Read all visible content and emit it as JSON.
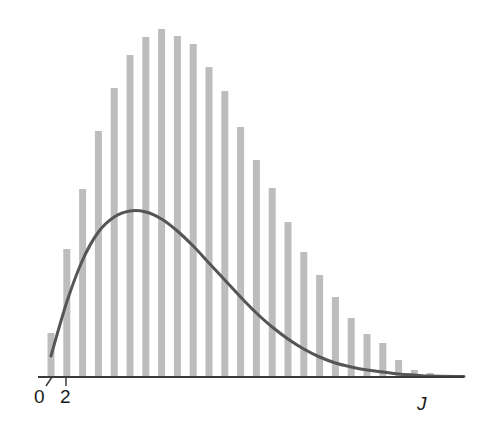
{
  "chart_data": {
    "type": "bar",
    "title": "",
    "xlabel": "J",
    "ylabel": "",
    "x_tick_labels": [
      "0",
      "2"
    ],
    "categories": [
      0,
      1,
      2,
      3,
      4,
      5,
      6,
      7,
      8,
      9,
      10,
      11,
      12,
      13,
      14,
      15,
      16,
      17,
      18,
      19,
      20,
      21,
      22,
      23,
      24
    ],
    "series": [
      {
        "name": "bars",
        "kind": "bar",
        "values": [
          44,
          128,
          188,
          246,
          289,
          322,
          340,
          348,
          341,
          333,
          310,
          286,
          250,
          217,
          189,
          155,
          125,
          102,
          80,
          59,
          43,
          34,
          17,
          7,
          4
        ]
      },
      {
        "name": "curve",
        "kind": "line",
        "points": [
          [
            0,
            21
          ],
          [
            1,
            75
          ],
          [
            2,
            117
          ],
          [
            3,
            145
          ],
          [
            4,
            160
          ],
          [
            5,
            166
          ],
          [
            6,
            165
          ],
          [
            7,
            158
          ],
          [
            8,
            146
          ],
          [
            9,
            131
          ],
          [
            10,
            114
          ],
          [
            11,
            97
          ],
          [
            12,
            80
          ],
          [
            13,
            64
          ],
          [
            14,
            50
          ],
          [
            15,
            38
          ],
          [
            16,
            28
          ],
          [
            17,
            20
          ],
          [
            18,
            14
          ],
          [
            19,
            10
          ],
          [
            20,
            7
          ],
          [
            21,
            5
          ],
          [
            22,
            3
          ],
          [
            23,
            2
          ],
          [
            24,
            1
          ]
        ]
      }
    ],
    "ylim": [
      0,
      360
    ],
    "grid": false,
    "legend": null,
    "colors": {
      "bar": "#bdbdbd",
      "curve": "#555555",
      "axis": "#3a3a3a"
    }
  },
  "labels": {
    "tick_0": "0",
    "tick_2": "2",
    "x_axis_var": "J"
  }
}
